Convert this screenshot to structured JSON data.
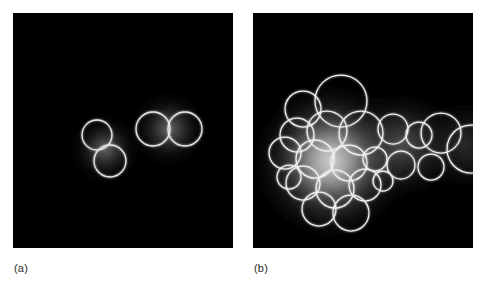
{
  "figure": {
    "caption_style": "panel-labels",
    "background_color": "#ffffff",
    "panel_background_color": "#000000",
    "annotation_color": "#e8e8e8",
    "glow_color": "#ffffff"
  },
  "panels": [
    {
      "id": "a",
      "label": "(a)",
      "name": "panel-a",
      "description": "dark field image with four bright circular annotations: a diagonal pair on the left and a touching horizontal pair on the right",
      "width": 220,
      "height": 235,
      "circle_count": 4,
      "glow_count": 2
    },
    {
      "id": "b",
      "label": "(b)",
      "name": "panel-b",
      "description": "dark field image with a bright diffuse blob on the left and a dimmer halo extending to the right, overlaid with twenty-two circular annotations forming a dense cluster and a chain",
      "width": 220,
      "height": 235,
      "circle_count": 22,
      "glow_count": 3
    }
  ],
  "chart_data": {
    "type": "scatter",
    "title": "",
    "xlabel": "",
    "ylabel": "",
    "panel_a": {
      "label": "(a)",
      "circles": [
        {
          "cx": 84,
          "cy": 122,
          "r": 15
        },
        {
          "cx": 97,
          "cy": 148,
          "r": 16
        },
        {
          "cx": 140,
          "cy": 116,
          "r": 17
        },
        {
          "cx": 172,
          "cy": 116,
          "r": 17
        }
      ],
      "glows": [
        {
          "cx": 92,
          "cy": 136,
          "r": 40,
          "intensity": 0.55
        },
        {
          "cx": 156,
          "cy": 116,
          "r": 44,
          "intensity": 0.6
        }
      ]
    },
    "panel_b": {
      "label": "(b)",
      "circles": [
        {
          "cx": 50,
          "cy": 96,
          "r": 18
        },
        {
          "cx": 88,
          "cy": 88,
          "r": 26
        },
        {
          "cx": 44,
          "cy": 122,
          "r": 17
        },
        {
          "cx": 74,
          "cy": 118,
          "r": 20
        },
        {
          "cx": 108,
          "cy": 120,
          "r": 22
        },
        {
          "cx": 32,
          "cy": 140,
          "r": 16
        },
        {
          "cx": 62,
          "cy": 146,
          "r": 19
        },
        {
          "cx": 96,
          "cy": 150,
          "r": 18
        },
        {
          "cx": 50,
          "cy": 170,
          "r": 17
        },
        {
          "cx": 82,
          "cy": 176,
          "r": 19
        },
        {
          "cx": 112,
          "cy": 172,
          "r": 16
        },
        {
          "cx": 66,
          "cy": 196,
          "r": 17
        },
        {
          "cx": 98,
          "cy": 200,
          "r": 18
        },
        {
          "cx": 36,
          "cy": 164,
          "r": 12
        },
        {
          "cx": 122,
          "cy": 146,
          "r": 12
        },
        {
          "cx": 140,
          "cy": 116,
          "r": 15
        },
        {
          "cx": 166,
          "cy": 122,
          "r": 13
        },
        {
          "cx": 148,
          "cy": 152,
          "r": 14
        },
        {
          "cx": 178,
          "cy": 154,
          "r": 13
        },
        {
          "cx": 188,
          "cy": 120,
          "r": 20
        },
        {
          "cx": 218,
          "cy": 136,
          "r": 24
        },
        {
          "cx": 130,
          "cy": 168,
          "r": 10
        }
      ],
      "glows": [
        {
          "cx": 78,
          "cy": 148,
          "r": 86,
          "intensity": 0.95
        },
        {
          "cx": 150,
          "cy": 132,
          "r": 62,
          "intensity": 0.45
        },
        {
          "cx": 212,
          "cy": 132,
          "r": 52,
          "intensity": 0.32
        }
      ]
    }
  }
}
